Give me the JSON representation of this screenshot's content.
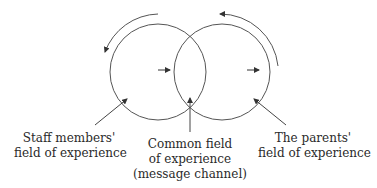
{
  "diagram": {
    "type": "overlapping-circles communication model",
    "colors": {
      "stroke": "#444444",
      "text": "#2a2a2a",
      "background": "#ffffff"
    },
    "circles": [
      {
        "id": "staff",
        "cx": 158,
        "cy": 72,
        "r": 48
      },
      {
        "id": "parents",
        "cx": 222,
        "cy": 72,
        "r": 48
      }
    ],
    "labels": {
      "staff": {
        "line1": "Staff members'",
        "line2": "field of experience"
      },
      "common": {
        "line1": "Common field",
        "line2": "of experience",
        "line3": "(message channel)"
      },
      "parents": {
        "line1": "The parents'",
        "line2": "field of experience"
      }
    }
  }
}
